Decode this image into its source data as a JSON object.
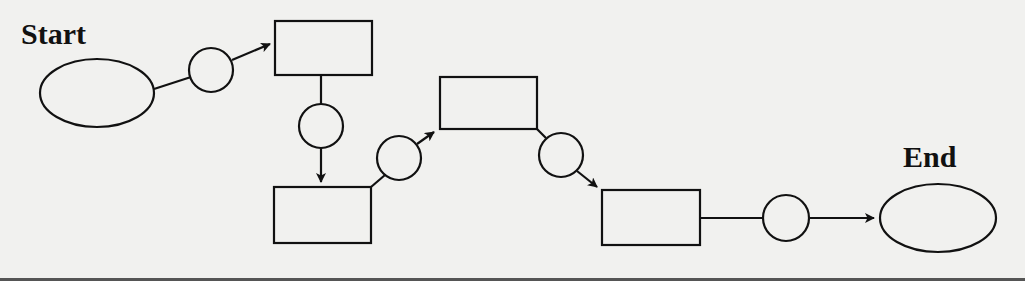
{
  "diagram": {
    "type": "flowchart",
    "labels": {
      "start": "Start",
      "end": "End"
    },
    "colors": {
      "background": "#f1f1ef",
      "stroke": "#111111"
    },
    "nodes": [
      {
        "id": "start",
        "shape": "ellipse",
        "label": "Start"
      },
      {
        "id": "c1",
        "shape": "circle"
      },
      {
        "id": "b1",
        "shape": "rectangle"
      },
      {
        "id": "c2",
        "shape": "circle"
      },
      {
        "id": "b2",
        "shape": "rectangle"
      },
      {
        "id": "c3",
        "shape": "circle"
      },
      {
        "id": "b3",
        "shape": "rectangle"
      },
      {
        "id": "c4",
        "shape": "circle"
      },
      {
        "id": "b4",
        "shape": "rectangle"
      },
      {
        "id": "c5",
        "shape": "circle"
      },
      {
        "id": "end",
        "shape": "ellipse",
        "label": "End"
      }
    ],
    "edges": [
      {
        "from": "start",
        "to": "c1",
        "arrow": false
      },
      {
        "from": "c1",
        "to": "b1",
        "arrow": true
      },
      {
        "from": "b1",
        "to": "c2",
        "arrow": false
      },
      {
        "from": "c2",
        "to": "b2",
        "arrow": true
      },
      {
        "from": "b2",
        "to": "c3",
        "arrow": false
      },
      {
        "from": "c3",
        "to": "b3",
        "arrow": true
      },
      {
        "from": "b3",
        "to": "c4",
        "arrow": false
      },
      {
        "from": "c4",
        "to": "b4",
        "arrow": true
      },
      {
        "from": "b4",
        "to": "c5",
        "arrow": false
      },
      {
        "from": "c5",
        "to": "end",
        "arrow": true
      }
    ]
  }
}
